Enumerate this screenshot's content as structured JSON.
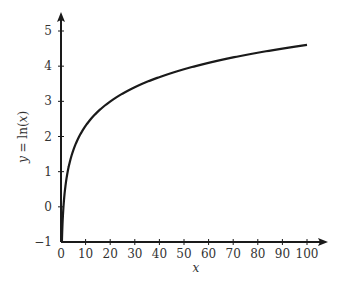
{
  "chart_data": {
    "type": "line",
    "title": "",
    "xlabel": "x",
    "ylabel": "y = ln(x)",
    "ylabel_parts": {
      "var": "y",
      "eq": " = ln(",
      "arg": "x",
      "close": ")"
    },
    "xlim": [
      0,
      100
    ],
    "ylim": [
      -1,
      5
    ],
    "xticks": [
      0,
      10,
      20,
      30,
      40,
      50,
      60,
      70,
      80,
      90,
      100
    ],
    "yticks": [
      -1,
      0,
      1,
      2,
      3,
      4,
      5
    ],
    "xtick_labels": [
      "0",
      "10",
      "20",
      "30",
      "40",
      "50",
      "60",
      "70",
      "80",
      "90",
      "100"
    ],
    "ytick_labels": [
      "−1",
      "0",
      "1",
      "2",
      "3",
      "4",
      "5"
    ],
    "grid": false,
    "legend": null,
    "series": [
      {
        "name": "ln(x)",
        "function": "ln(x)",
        "x": [
          0.37,
          0.5,
          1,
          2,
          3,
          5,
          7,
          10,
          15,
          20,
          30,
          40,
          50,
          60,
          70,
          80,
          90,
          100
        ],
        "y": [
          -1.0,
          -0.69,
          0.0,
          0.69,
          1.1,
          1.61,
          1.95,
          2.3,
          2.71,
          3.0,
          3.4,
          3.69,
          3.91,
          4.09,
          4.25,
          4.38,
          4.5,
          4.61
        ]
      }
    ],
    "colors": {
      "curve": "#1a1a1a",
      "axis": "#1a1a1a",
      "text": "#333333"
    }
  }
}
